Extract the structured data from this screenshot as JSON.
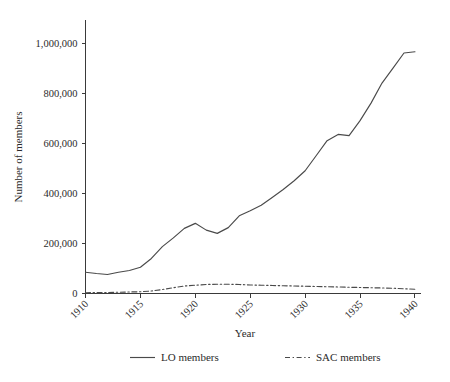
{
  "chart_data": {
    "type": "line",
    "title": "",
    "xlabel": "Year",
    "ylabel": "Number of members",
    "xlim": [
      1910,
      1940
    ],
    "ylim": [
      0,
      1000000
    ],
    "grid": false,
    "legend_position": "bottom",
    "xticks": [
      1910,
      1915,
      1920,
      1925,
      1930,
      1935,
      1940
    ],
    "xtick_labels": [
      "1910",
      "1915",
      "1920",
      "1925",
      "1930",
      "1935",
      "1940"
    ],
    "yticks": [
      0,
      200000,
      400000,
      600000,
      800000,
      1000000
    ],
    "ytick_labels": [
      "0",
      "200,000",
      "400,000",
      "600,000",
      "800,000",
      "1,000,000"
    ],
    "x": [
      1910,
      1911,
      1912,
      1913,
      1914,
      1915,
      1916,
      1917,
      1918,
      1919,
      1920,
      1921,
      1922,
      1923,
      1924,
      1925,
      1926,
      1927,
      1928,
      1929,
      1930,
      1931,
      1932,
      1933,
      1934,
      1935,
      1936,
      1937,
      1938,
      1939,
      1940
    ],
    "series": [
      {
        "name": "LO members",
        "style": "solid",
        "values": [
          85000,
          80000,
          76000,
          85000,
          92000,
          105000,
          140000,
          187000,
          222000,
          260000,
          280000,
          253000,
          240000,
          263000,
          310000,
          330000,
          352000,
          383000,
          415000,
          450000,
          490000,
          550000,
          610000,
          635000,
          630000,
          690000,
          760000,
          840000,
          900000,
          960000,
          965000
        ]
      },
      {
        "name": "SAC members",
        "style": "dash-dot",
        "values": [
          3000,
          3500,
          4000,
          5000,
          6000,
          7000,
          10000,
          16000,
          23000,
          30000,
          33000,
          36000,
          37000,
          37000,
          36000,
          34000,
          33000,
          32000,
          31000,
          30000,
          29000,
          28000,
          27000,
          26000,
          25000,
          24000,
          23000,
          22000,
          21000,
          19000,
          17000
        ]
      }
    ]
  },
  "legend": {
    "items": [
      {
        "label": "LO members",
        "style": "solid"
      },
      {
        "label": "SAC members",
        "style": "dash-dot"
      }
    ]
  },
  "colors": {
    "background": "#ffffff",
    "line": "#4a4a4a",
    "axis": "#3a3a3a",
    "text": "#2b2b2b"
  }
}
